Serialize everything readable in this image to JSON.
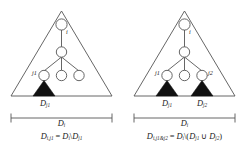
{
  "figure": {
    "type": "tree-subtree-set-difference-diagram",
    "stroke_color": "#444444",
    "fill_color": "#111111",
    "background": "#ffffff",
    "panels": [
      {
        "id": "left",
        "name": "single-excluded-subtree",
        "outer_triangle_label": "D_i",
        "tree": {
          "root_label": "i",
          "levels": 3,
          "leaf_count": 3,
          "labeled_leaves": [
            {
              "position": "left",
              "label": "j1"
            }
          ]
        },
        "filled_subtrees": [
          {
            "label": "j1",
            "under_leaf": "left"
          }
        ],
        "span_labels": {
          "inner": "Dj1",
          "inner_base": "D",
          "inner_sub": "j1",
          "outer_base": "D",
          "outer_sub": "i"
        },
        "formula": {
          "lhs_base": "D",
          "lhs_sub": "i,j1",
          "equals": "=",
          "rhs_base": "D",
          "rhs_sub": "i",
          "setminus": "\\",
          "rhs2_base": "D",
          "rhs2_sub": "j1",
          "plain": "D(i,j1) = D(i) \\ D(j1)"
        }
      },
      {
        "id": "right",
        "name": "two-excluded-subtrees",
        "outer_triangle_label": "D_i",
        "tree": {
          "root_label": "i",
          "levels": 3,
          "leaf_count": 3,
          "labeled_leaves": [
            {
              "position": "left",
              "label": "j1"
            },
            {
              "position": "right",
              "label": "j2"
            }
          ]
        },
        "filled_subtrees": [
          {
            "label": "j1",
            "under_leaf": "left"
          },
          {
            "label": "j2",
            "under_leaf": "right"
          }
        ],
        "span_labels": {
          "inner_left_base": "D",
          "inner_left_sub": "j1",
          "inner_right_base": "D",
          "inner_right_sub": "j2",
          "outer_base": "D",
          "outer_sub": "i"
        },
        "formula": {
          "lhs_base": "D",
          "lhs_sub": "i,j1&j2",
          "equals": "=",
          "rhs_base": "D",
          "rhs_sub": "i",
          "setminus": "\\",
          "open_paren": "(",
          "term1_base": "D",
          "term1_sub": "j1",
          "union": "∪",
          "term2_base": "D",
          "term2_sub": "j2",
          "close_paren": ")",
          "plain": "D(i,j1&j2) = D(i) \\ ( D(j1) ∪ D(j2) )"
        }
      }
    ]
  }
}
